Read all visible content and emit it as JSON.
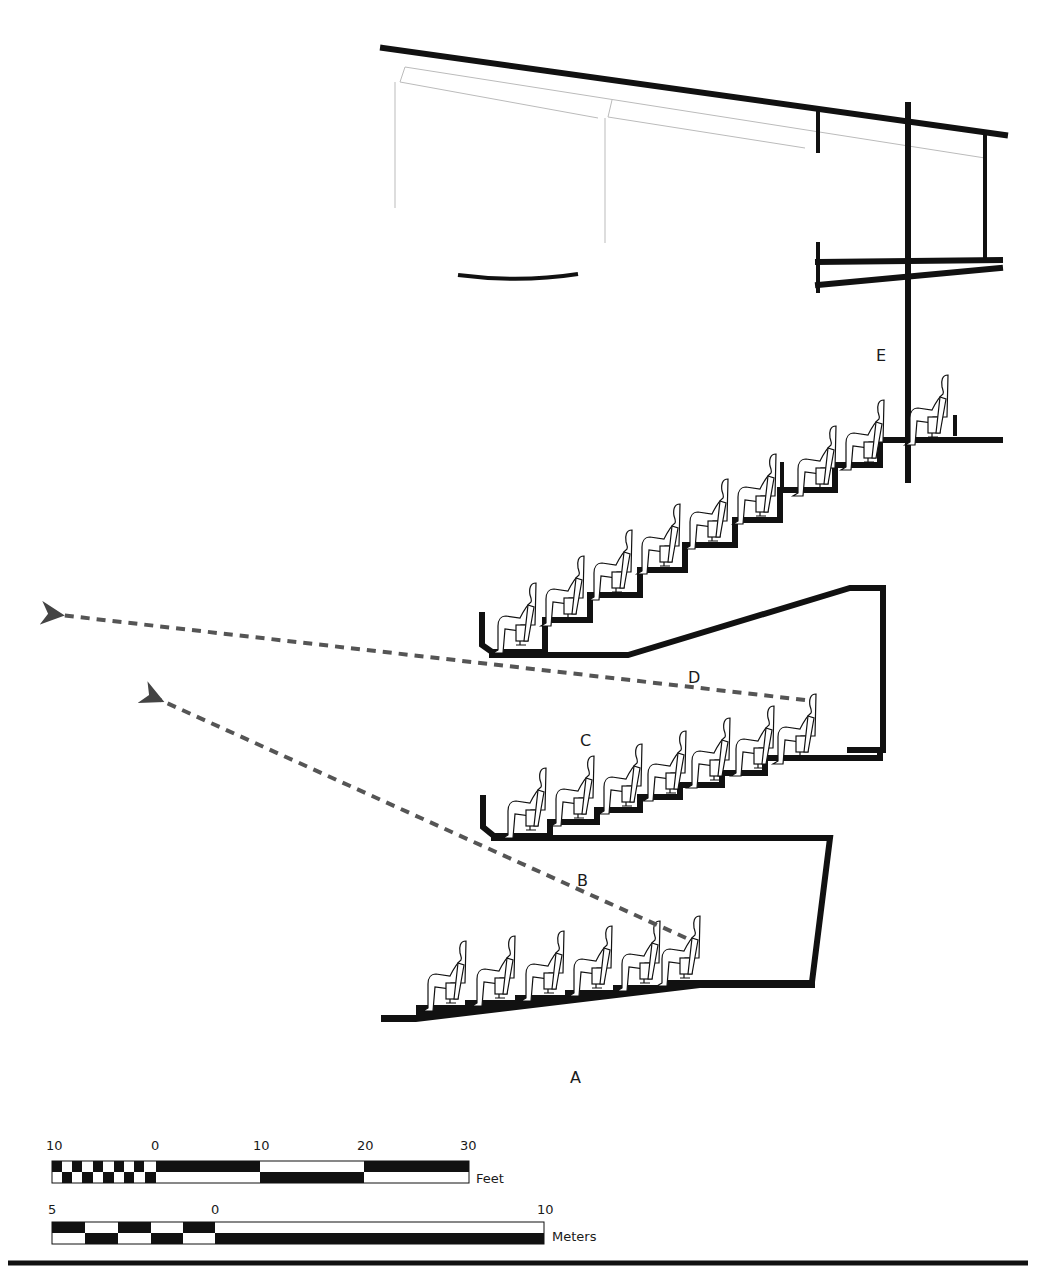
{
  "diagram": {
    "type": "architectural-section",
    "labels": {
      "A": "A",
      "B": "B",
      "C": "C",
      "D": "D",
      "E": "E"
    },
    "tiers": [
      {
        "id": "orchestra",
        "label_ref": "A",
        "seats": 6
      },
      {
        "id": "first-balcony",
        "label_ref": "C",
        "seats": 7
      },
      {
        "id": "second-balcony",
        "seats": 10
      },
      {
        "id": "rear-box",
        "label_ref": "E",
        "seats": 1
      }
    ],
    "sightlines": [
      {
        "label_ref": "B",
        "from": "orchestra rear seat",
        "style": "dashed-arrow"
      },
      {
        "label_ref": "D",
        "from": "first balcony rear seat",
        "style": "dashed-arrow"
      }
    ],
    "colors": {
      "line": "#111111",
      "sightline": "#555555",
      "ghost": "#bbbbbb"
    }
  },
  "scale": {
    "feet": {
      "ticks": [
        "10",
        "0",
        "10",
        "20",
        "30"
      ],
      "unit": "Feet"
    },
    "meters": {
      "ticks": [
        "5",
        "0",
        "10"
      ],
      "unit": "Meters"
    }
  }
}
